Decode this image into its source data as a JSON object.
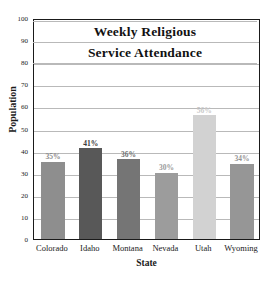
{
  "chart_data": {
    "type": "bar",
    "title_lines": [
      "Weekly Religious",
      "Service Attendance"
    ],
    "xlabel": "State",
    "ylabel": "Population",
    "categories": [
      "Colorado",
      "Idaho",
      "Montana",
      "Nevada",
      "Utah",
      "Wyoming"
    ],
    "values": [
      35,
      41,
      36,
      30,
      56,
      34
    ],
    "value_labels": [
      "35%",
      "41%",
      "36%",
      "30%",
      "56%",
      "34%"
    ],
    "bar_colors": [
      "#8e8e8e",
      "#585858",
      "#757575",
      "#9c9c9c",
      "#d2d2d2",
      "#969696"
    ],
    "label_colors": [
      "#8a8a8a",
      "#3a3a3a",
      "#6f6f6f",
      "#9a9a9a",
      "#c9c9c9",
      "#949494"
    ],
    "ylim": [
      0,
      100
    ],
    "ytick_values": [
      0,
      10,
      20,
      30,
      40,
      50,
      60,
      70,
      80,
      90,
      100
    ],
    "ytick_labels": [
      "0",
      "10",
      "20",
      "30",
      "40",
      "50",
      "60",
      "70",
      "80",
      "90",
      "100"
    ],
    "grid": true,
    "grid_color": "#b9b9b9",
    "legend": "none",
    "frame_color": "#1a1a1a",
    "background": "#ffffff"
  }
}
